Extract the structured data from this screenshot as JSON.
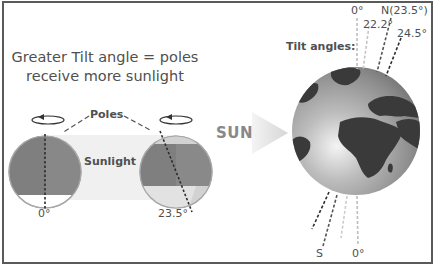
{
  "left_panel": {
    "headline_line1": "Greater Tilt angle = poles",
    "headline_line2": "receive more sunlight",
    "poles_label": "Poles",
    "sunlight_label": "Sunlight",
    "globes": [
      {
        "angle_label": "0°",
        "tilt_deg": 0
      },
      {
        "angle_label": "23.5°",
        "tilt_deg": 23.5
      }
    ]
  },
  "sun_arrow": {
    "label": "SUN"
  },
  "right_panel": {
    "tilt_angles_label": "Tilt angles:",
    "top_axis_labels": [
      "0°",
      "22.2°",
      "N(23.5°)",
      "24.5°"
    ],
    "bottom_axis_labels": [
      "S",
      "0°"
    ]
  },
  "colors": {
    "frame": "#5a5a5a",
    "text": "#505050",
    "globe_dark": "#7d7d7d",
    "globe_light": "#cfcfcf",
    "sunlight_band": "#eeeeee",
    "continents": "#3a3a3a",
    "arrow": "#dcdcdc"
  }
}
